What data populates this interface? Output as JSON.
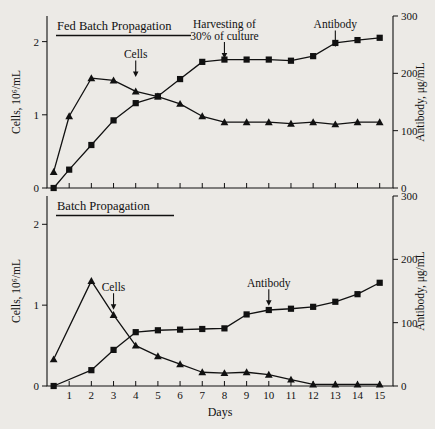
{
  "figure": {
    "background_color": "#eceae6",
    "ink_color": "#111111",
    "xlabel": "Days",
    "x_ticks": [
      1,
      2,
      3,
      4,
      5,
      6,
      7,
      8,
      9,
      10,
      11,
      12,
      13,
      14,
      15
    ],
    "xlim": [
      0,
      15.6
    ],
    "left_axis_label": "Cells, 10⁶/mL",
    "left_ticks": [
      0,
      1,
      2
    ],
    "left_lim": [
      0,
      2.35
    ],
    "right_axis_label": "Antibody, μg/mL",
    "right_ticks": [
      0,
      100,
      200,
      300
    ],
    "right_lim": [
      0,
      300
    ]
  },
  "chart_data": [
    {
      "type": "line",
      "title": "Fed Batch Propagation",
      "xlabel": "",
      "ylabel": "Cells, 10⁶/mL",
      "y2label": "Antibody, μg/mL",
      "xlim": [
        0,
        15.6
      ],
      "ylim": [
        0,
        2.35
      ],
      "y2lim": [
        0,
        300
      ],
      "grid": false,
      "legend": "none",
      "annotations": [
        {
          "text": "Cells",
          "target_x": 4.0,
          "target_y": 1.47,
          "axis": "left"
        },
        {
          "text": "Harvesting of\n30% of culture",
          "target_x": 8.0,
          "target_y": 1.72,
          "axis": "left"
        },
        {
          "text": "Antibody",
          "target_x": 13.0,
          "target_y": 1.88,
          "axis": "left"
        }
      ],
      "series": [
        {
          "name": "Cells",
          "marker": "triangle",
          "axis": "left",
          "units": "10^6/mL",
          "x": [
            0.3,
            1,
            2,
            3,
            4,
            5,
            6,
            7,
            8,
            9,
            10,
            11,
            12,
            13,
            14,
            15
          ],
          "values": [
            0.22,
            0.98,
            1.5,
            1.47,
            1.32,
            1.25,
            1.15,
            0.98,
            0.9,
            0.9,
            0.9,
            0.88,
            0.9,
            0.87,
            0.9,
            0.9
          ]
        },
        {
          "name": "Antibody",
          "marker": "square",
          "axis": "right",
          "units": "μg/mL",
          "x": [
            0.3,
            1,
            2,
            3,
            4,
            5,
            6,
            7,
            8,
            9,
            10,
            11,
            12,
            13,
            14,
            15
          ],
          "values": [
            0,
            32,
            75,
            118,
            148,
            160,
            190,
            220,
            224,
            224,
            224,
            222,
            230,
            253,
            258,
            262
          ]
        }
      ]
    },
    {
      "type": "line",
      "title": "Batch Propagation",
      "xlabel": "Days",
      "ylabel": "Cells, 10⁶/mL",
      "y2label": "Antibody, μg/mL",
      "xlim": [
        0,
        15.6
      ],
      "ylim": [
        0,
        2.35
      ],
      "y2lim": [
        0,
        300
      ],
      "grid": false,
      "legend": "none",
      "annotations": [
        {
          "text": "Cells",
          "target_x": 3.0,
          "target_y": 0.9,
          "axis": "left"
        },
        {
          "text": "Antibody",
          "target_x": 10.0,
          "target_y": 0.95,
          "axis": "left"
        }
      ],
      "series": [
        {
          "name": "Cells",
          "marker": "triangle",
          "axis": "left",
          "units": "10^6/mL",
          "x": [
            0.3,
            2,
            3,
            4,
            5,
            6,
            7,
            8,
            9,
            10,
            11,
            12,
            13,
            14,
            15
          ],
          "values": [
            0.33,
            1.3,
            0.88,
            0.5,
            0.37,
            0.27,
            0.17,
            0.16,
            0.17,
            0.14,
            0.08,
            0.02,
            0.02,
            0.02,
            0.02
          ]
        },
        {
          "name": "Antibody",
          "marker": "square",
          "axis": "right",
          "units": "μg/mL",
          "x": [
            0.3,
            2,
            3,
            4,
            5,
            6,
            7,
            8,
            9,
            10,
            11,
            12,
            13,
            14,
            15
          ],
          "values": [
            0,
            25,
            57,
            85,
            88,
            89,
            90,
            91,
            113,
            120,
            122,
            125,
            133,
            145,
            163
          ]
        }
      ]
    }
  ]
}
